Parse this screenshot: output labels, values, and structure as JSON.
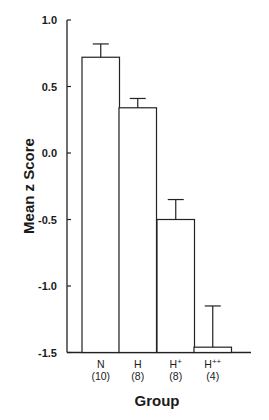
{
  "chart_data": {
    "type": "bar",
    "title": "",
    "xlabel": "Group",
    "ylabel": "Mean z Score",
    "ylim": [
      -1.5,
      1.0
    ],
    "yticks": [
      "1.0",
      "0.5",
      "0.0",
      "-0.5",
      "-1.0",
      "-1.5"
    ],
    "categories": [
      "N",
      "H",
      "H+",
      "H++"
    ],
    "category_labels": [
      {
        "base": "N",
        "sup": "",
        "n": "(10)"
      },
      {
        "base": "H",
        "sup": "",
        "n": "(8)"
      },
      {
        "base": "H",
        "sup": "+",
        "n": "(8)"
      },
      {
        "base": "H",
        "sup": "++",
        "n": "(4)"
      }
    ],
    "values": [
      0.72,
      0.34,
      -0.5,
      -1.46
    ],
    "error_upper": [
      0.82,
      0.41,
      -0.35,
      -1.15
    ],
    "bar_baseline": -1.5,
    "grid": false,
    "legend": null,
    "bar_fill": "#ffffff",
    "bar_stroke": "#222222"
  }
}
